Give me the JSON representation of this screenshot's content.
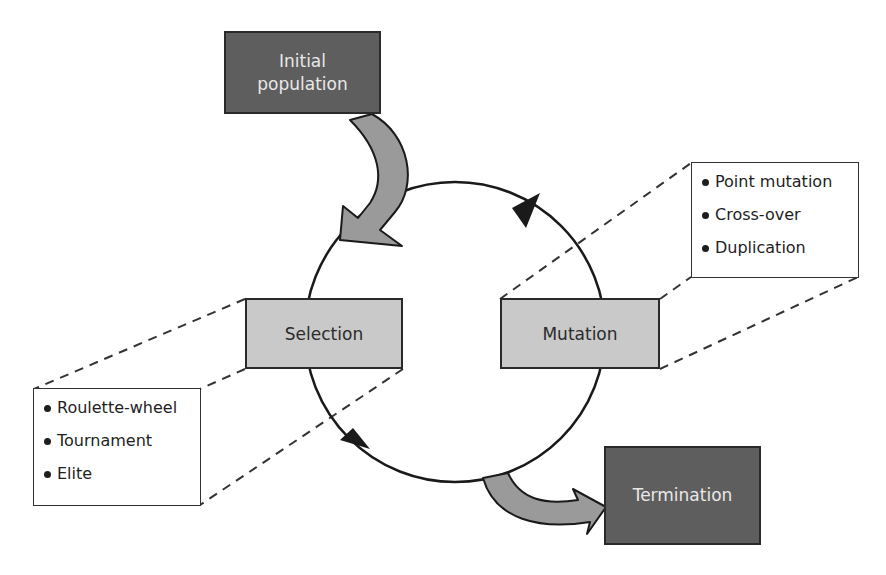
{
  "diagram": {
    "nodes": {
      "initial_population": {
        "label_line1": "Initial",
        "label_line2": "population"
      },
      "selection": {
        "label": "Selection"
      },
      "mutation": {
        "label": "Mutation"
      },
      "termination": {
        "label": "Termination"
      }
    },
    "selection_methods": {
      "items": [
        {
          "label": "Roulette-wheel"
        },
        {
          "label": "Tournament"
        },
        {
          "label": "Elite"
        }
      ]
    },
    "mutation_methods": {
      "items": [
        {
          "label": "Point mutation"
        },
        {
          "label": "Cross-over"
        },
        {
          "label": "Duplication"
        }
      ]
    },
    "colors": {
      "dark_box": "#5e5e5e",
      "light_box": "#c9c9c9",
      "arrow_fill": "#9a9a9a",
      "stroke": "#1a1a1a"
    }
  }
}
